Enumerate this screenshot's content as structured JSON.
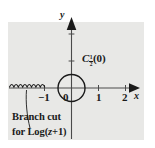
{
  "figure": {
    "title": "",
    "background_color": "#e8e8e6",
    "ink_color": "#1a1a1a",
    "axes": {
      "x_label": "x",
      "y_label": "y",
      "x_ticks": [
        {
          "value": -1,
          "label": "−1"
        },
        {
          "value": 0,
          "label": "0"
        },
        {
          "value": 1,
          "label": "1"
        },
        {
          "value": 2,
          "label": "2"
        }
      ],
      "y_ticks": [
        {
          "value": 1,
          "label": ""
        },
        {
          "value": 2,
          "label": ""
        }
      ]
    },
    "contour": {
      "name": "circle-contour",
      "center": [
        0,
        0
      ],
      "radius_units": 0.5,
      "label_base": "C",
      "label_subscript_num": "1",
      "label_subscript_den": "2",
      "label_arg": "(0)"
    },
    "branch_cut": {
      "name": "branch-cut-zigzag",
      "from_x": -3.0,
      "to_x": -1.0,
      "at_y": 0
    },
    "caption": {
      "line1": "Branch cut",
      "line2_prefix": "for Log(",
      "line2_var": "z",
      "line2_suffix": "+1)"
    }
  }
}
